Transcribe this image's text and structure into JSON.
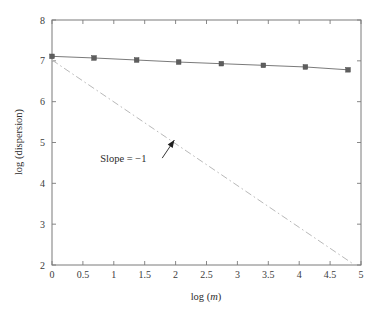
{
  "chart_data": {
    "type": "line",
    "title": "",
    "xlabel": "log (m)",
    "ylabel": "log (dispersion)",
    "xlim": [
      0,
      5
    ],
    "ylim": [
      2,
      8
    ],
    "grid": false,
    "legend": "none",
    "xticks": [
      0,
      0.5,
      1,
      1.5,
      2,
      2.5,
      3,
      3.5,
      4,
      4.5,
      5
    ],
    "xticklabels": [
      "0",
      "0.5",
      "1",
      "1.5",
      "2",
      "2.5",
      "3",
      "3.5",
      "4",
      "4.5",
      "5"
    ],
    "yticks": [
      2,
      3,
      4,
      5,
      6,
      7,
      8
    ],
    "yticklabels": [
      "2",
      "3",
      "4",
      "5",
      "6",
      "7",
      "8"
    ],
    "series": [
      {
        "name": "dispersion",
        "style": "solid-with-markers",
        "marker": "square",
        "color": "#6b6b6b",
        "x": [
          0.0,
          0.68,
          1.37,
          2.05,
          2.74,
          3.42,
          4.1,
          4.79
        ],
        "y": [
          7.11,
          7.07,
          7.02,
          6.97,
          6.93,
          6.89,
          6.85,
          6.78
        ]
      },
      {
        "name": "Slope = -1 reference",
        "style": "dash-dot",
        "marker": "none",
        "color": "#b9b9b9",
        "x": [
          0.0,
          4.85
        ],
        "y": [
          7.02,
          2.05
        ]
      }
    ],
    "annotations": [
      {
        "text": "Slope = −1",
        "x": 0.78,
        "y": 4.52,
        "arrow_to_x": 1.98,
        "arrow_to_y": 5.06
      }
    ]
  },
  "axes": {
    "x_label": "log (",
    "x_label_italic": "m",
    "x_label_tail": ")",
    "y_label": "log (dispersion)"
  }
}
